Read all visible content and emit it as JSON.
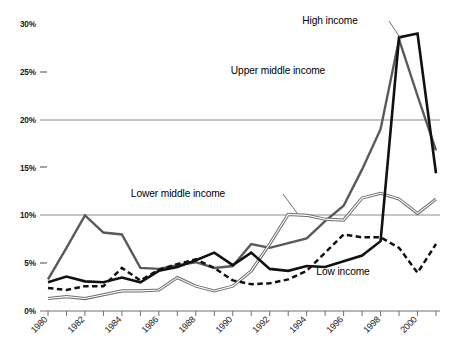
{
  "chart_data": {
    "type": "line",
    "title": "",
    "subtitle": "",
    "xlabel": "",
    "ylabel": "",
    "x": [
      1980,
      1981,
      1982,
      1983,
      1984,
      1985,
      1986,
      1987,
      1988,
      1989,
      1990,
      1991,
      1992,
      1993,
      1994,
      1995,
      1996,
      1997,
      1998,
      1999,
      2000,
      2001
    ],
    "xlim": [
      1980,
      2001
    ],
    "ylim": [
      0,
      30
    ],
    "ytick_values": [
      0,
      5,
      10,
      15,
      20,
      25,
      30
    ],
    "ytick_labels": [
      "0%",
      "5%",
      "10%",
      "15%",
      "20%",
      "25%",
      "30%"
    ],
    "xtick_labels": [
      "1980",
      "1982",
      "1984",
      "1986",
      "1988",
      "1990",
      "1992",
      "1994",
      "1996",
      "1998",
      "2000"
    ],
    "xtick_label_values": [
      1980,
      1982,
      1984,
      1986,
      1988,
      1990,
      1992,
      1994,
      1996,
      1998,
      2000
    ],
    "gridlines_at": [
      10,
      20
    ],
    "grid": "horizontal-partial",
    "legend_position": "inline-annotations",
    "series": [
      {
        "name": "High income",
        "style": "solid-black-thick",
        "color": "#111111",
        "values": [
          3.0,
          3.6,
          3.1,
          3.0,
          3.5,
          3.0,
          4.2,
          4.6,
          5.3,
          6.1,
          4.8,
          6.1,
          4.4,
          4.2,
          4.7,
          4.6,
          5.2,
          5.8,
          7.3,
          28.6,
          29.0,
          14.4
        ]
      },
      {
        "name": "Upper middle income",
        "style": "solid-gray",
        "color": "#5a5a5a",
        "values": [
          3.3,
          6.6,
          10.0,
          8.2,
          8.0,
          4.5,
          4.4,
          4.8,
          5.1,
          4.5,
          4.7,
          7.0,
          6.6,
          7.1,
          7.6,
          9.4,
          11.0,
          14.8,
          19.0,
          28.4,
          22.5,
          16.8
        ]
      },
      {
        "name": "Lower middle income",
        "style": "double-line-gray",
        "color": "#6d6d6d",
        "values": [
          1.3,
          1.5,
          1.3,
          1.7,
          2.1,
          2.1,
          2.2,
          3.5,
          2.6,
          2.1,
          2.6,
          4.2,
          7.0,
          10.1,
          10.0,
          9.6,
          9.5,
          11.8,
          12.3,
          11.7,
          10.2,
          11.7
        ]
      },
      {
        "name": "Low income",
        "style": "dashed-black",
        "color": "#111111",
        "values": [
          2.4,
          2.2,
          2.6,
          2.6,
          4.5,
          3.2,
          4.3,
          4.9,
          5.4,
          4.5,
          3.2,
          2.8,
          2.9,
          3.3,
          4.2,
          6.1,
          8.0,
          7.7,
          7.7,
          6.6,
          4.0,
          7.0
        ]
      }
    ],
    "annotations": [
      {
        "label": "High income",
        "x_px": 330,
        "y_px": 24,
        "leader": true
      },
      {
        "label": "Upper middle income",
        "x_px": 278,
        "y_px": 74,
        "leader": false
      },
      {
        "label": "Lower middle income",
        "x_px": 178,
        "y_px": 196,
        "leader": true
      },
      {
        "label": "Low income",
        "x_px": 342,
        "y_px": 272,
        "leader": false
      }
    ]
  },
  "axis": {
    "y_labels": [
      "30%",
      "25%",
      "20%",
      "15%",
      "10%",
      "5%",
      "0%"
    ],
    "x_labels": [
      "1980",
      "1982",
      "1984",
      "1986",
      "1988",
      "1990",
      "1992",
      "1994",
      "1996",
      "1998",
      "2000"
    ]
  },
  "labels": {
    "high_income": "High income",
    "upper_middle_income": "Upper middle income",
    "lower_middle_income": "Lower middle income",
    "low_income": "Low income"
  },
  "colors": {
    "high_income": "#111111",
    "upper_middle_income": "#5a5a5a",
    "lower_middle_income": "#6d6d6d",
    "low_income": "#111111",
    "gridline": "#8c8c8c",
    "background": "#ffffff"
  }
}
